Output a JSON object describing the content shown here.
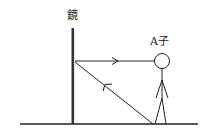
{
  "diagram": {
    "mirror_label": "鏡",
    "person_label": "A子",
    "colors": {
      "line": "#222222",
      "background": "#ffffff"
    },
    "elements": {
      "ground": {
        "x1": 20,
        "y1": 124,
        "x2": 198,
        "y2": 124
      },
      "mirror": {
        "x": 73,
        "y1": 28,
        "y2": 125
      },
      "ray_horizontal": {
        "from": [
          154,
          61
        ],
        "to": [
          75,
          61
        ],
        "arrow_direction": "right"
      },
      "ray_diagonal": {
        "from": [
          153,
          124
        ],
        "to": [
          75,
          62
        ],
        "arrow_direction": "up-left"
      },
      "person": {
        "head_center": [
          162,
          61
        ],
        "head_radius": 8
      }
    }
  }
}
